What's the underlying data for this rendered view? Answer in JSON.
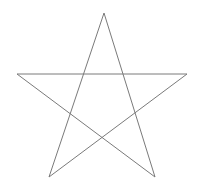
{
  "figure": {
    "shape_name": "five-pointed-star",
    "background_color": "#ffffff",
    "stroke_color": "#7a7a7a",
    "stroke_width": 1,
    "fill": "none",
    "canvas": {
      "width": 198,
      "height": 196
    },
    "vertices": [
      {
        "name": "top-apex",
        "x": 104,
        "y": 13
      },
      {
        "name": "right-point",
        "x": 187,
        "y": 74
      },
      {
        "name": "bottom-right-point",
        "x": 155,
        "y": 177
      },
      {
        "name": "bottom-left-point",
        "x": 49,
        "y": 177
      },
      {
        "name": "left-point",
        "x": 17,
        "y": 74
      }
    ],
    "draw_order": [
      0,
      2,
      4,
      1,
      3
    ],
    "path_d": "M 104 13 L 155 177 L 17 74 L 187 74 L 49 177 Z",
    "point_count": 5,
    "segment_count": 5
  }
}
